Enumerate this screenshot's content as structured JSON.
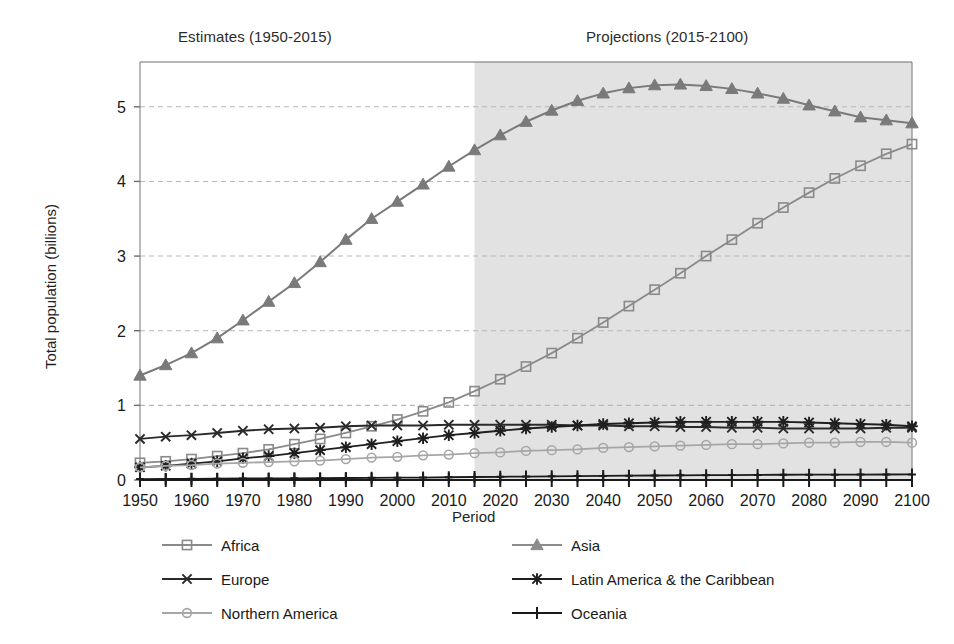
{
  "annotations": {
    "estimates_label": "Estimates (1950-2015)",
    "projections_label": "Projections (2015-2100)"
  },
  "axes": {
    "x_title": "Period",
    "y_title": "Total population (billions)"
  },
  "chart_data": {
    "type": "line",
    "title": "",
    "subtitle": "",
    "xlabel": "Period",
    "ylabel": "Total population (billions)",
    "xlim": [
      1950,
      2100
    ],
    "ylim": [
      0,
      5.6
    ],
    "yticks": [
      0,
      1,
      2,
      3,
      4,
      5
    ],
    "ytick_labels": [
      "0",
      "1",
      "2",
      "3",
      "4",
      "5"
    ],
    "xticks": [
      1950,
      1955,
      1960,
      1965,
      1970,
      1975,
      1980,
      1985,
      1990,
      1995,
      2000,
      2005,
      2010,
      2015,
      2020,
      2025,
      2030,
      2035,
      2040,
      2045,
      2050,
      2055,
      2060,
      2065,
      2070,
      2075,
      2080,
      2085,
      2090,
      2095,
      2100
    ],
    "xtick_labels": [
      "1950",
      "",
      "1960",
      "",
      "1970",
      "",
      "1980",
      "",
      "1990",
      "",
      "2000",
      "",
      "2010",
      "",
      "2020",
      "",
      "2030",
      "",
      "2040",
      "",
      "2050",
      "",
      "2060",
      "",
      "2070",
      "",
      "2080",
      "",
      "2090",
      "",
      "2100"
    ],
    "grid": "horizontal-dashed",
    "legend_position": "below-plot",
    "shaded_region": {
      "label": "Projections (2015-2100)",
      "x_start": 2015,
      "x_end": 2100,
      "color": "#e2e2e2"
    },
    "x": [
      1950,
      1955,
      1960,
      1965,
      1970,
      1975,
      1980,
      1985,
      1990,
      1995,
      2000,
      2005,
      2010,
      2015,
      2020,
      2025,
      2030,
      2035,
      2040,
      2045,
      2050,
      2055,
      2060,
      2065,
      2070,
      2075,
      2080,
      2085,
      2090,
      2095,
      2100
    ],
    "series": [
      {
        "name": "Africa",
        "marker": "square",
        "color": "#8a8a8a",
        "values": [
          0.23,
          0.25,
          0.28,
          0.32,
          0.36,
          0.41,
          0.48,
          0.55,
          0.63,
          0.72,
          0.81,
          0.92,
          1.04,
          1.19,
          1.35,
          1.52,
          1.7,
          1.9,
          2.11,
          2.33,
          2.55,
          2.77,
          3.0,
          3.22,
          3.44,
          3.65,
          3.85,
          4.04,
          4.21,
          4.37,
          4.5
        ]
      },
      {
        "name": "Asia",
        "marker": "triangle",
        "color": "#7a7a7a",
        "values": [
          1.4,
          1.54,
          1.7,
          1.9,
          2.14,
          2.39,
          2.64,
          2.92,
          3.22,
          3.5,
          3.73,
          3.96,
          4.2,
          4.42,
          4.62,
          4.8,
          4.95,
          5.08,
          5.18,
          5.25,
          5.29,
          5.3,
          5.28,
          5.24,
          5.18,
          5.11,
          5.02,
          4.94,
          4.86,
          4.82,
          4.78
        ]
      },
      {
        "name": "Europe",
        "marker": "x",
        "color": "#2a2a2a",
        "values": [
          0.55,
          0.58,
          0.6,
          0.63,
          0.66,
          0.68,
          0.69,
          0.7,
          0.72,
          0.73,
          0.73,
          0.73,
          0.74,
          0.74,
          0.74,
          0.74,
          0.74,
          0.73,
          0.73,
          0.72,
          0.72,
          0.71,
          0.71,
          0.7,
          0.7,
          0.69,
          0.69,
          0.69,
          0.69,
          0.7,
          0.7
        ]
      },
      {
        "name": "Latin America & the Caribbean",
        "marker": "asterisk",
        "color": "#1f1f1f",
        "values": [
          0.17,
          0.19,
          0.22,
          0.25,
          0.29,
          0.32,
          0.36,
          0.4,
          0.44,
          0.48,
          0.52,
          0.56,
          0.6,
          0.63,
          0.66,
          0.69,
          0.71,
          0.73,
          0.75,
          0.76,
          0.77,
          0.78,
          0.78,
          0.78,
          0.78,
          0.78,
          0.77,
          0.76,
          0.75,
          0.74,
          0.72
        ]
      },
      {
        "name": "Northern America",
        "marker": "circle",
        "color": "#a6a6a6",
        "values": [
          0.17,
          0.19,
          0.2,
          0.22,
          0.23,
          0.24,
          0.25,
          0.26,
          0.28,
          0.3,
          0.31,
          0.33,
          0.34,
          0.36,
          0.37,
          0.39,
          0.4,
          0.41,
          0.43,
          0.44,
          0.45,
          0.46,
          0.47,
          0.48,
          0.48,
          0.49,
          0.5,
          0.5,
          0.51,
          0.51,
          0.5
        ]
      },
      {
        "name": "Oceania",
        "marker": "plus",
        "color": "#1a1a1a",
        "values": [
          0.013,
          0.014,
          0.016,
          0.018,
          0.02,
          0.021,
          0.023,
          0.025,
          0.027,
          0.029,
          0.031,
          0.033,
          0.037,
          0.04,
          0.043,
          0.046,
          0.049,
          0.052,
          0.055,
          0.058,
          0.06,
          0.062,
          0.064,
          0.066,
          0.068,
          0.07,
          0.071,
          0.072,
          0.073,
          0.074,
          0.075
        ]
      }
    ]
  },
  "legend": [
    {
      "label": "Africa",
      "marker": "square",
      "color": "#8a8a8a"
    },
    {
      "label": "Asia",
      "marker": "triangle",
      "color": "#8c8c8c"
    },
    {
      "label": "Europe",
      "marker": "x",
      "color": "#2a2a2a"
    },
    {
      "label": "Latin America & the Caribbean",
      "marker": "asterisk",
      "color": "#1f1f1f"
    },
    {
      "label": "Northern America",
      "marker": "circle",
      "color": "#a6a6a6"
    },
    {
      "label": "Oceania",
      "marker": "plus",
      "color": "#1a1a1a"
    }
  ]
}
